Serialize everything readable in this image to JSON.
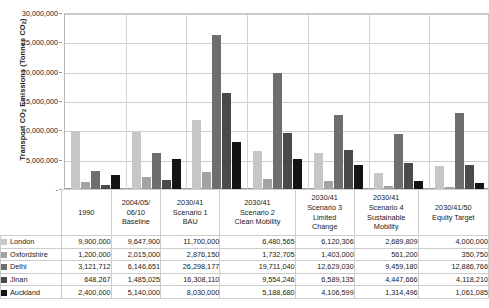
{
  "chart_data": {
    "type": "bar",
    "title": "",
    "ylabel": "Transport CO2 Emissions (Tonnes CO2)",
    "xlabel": "",
    "ylim": [
      0,
      30000000
    ],
    "ytick_values": [
      0,
      5000000,
      10000000,
      15000000,
      20000000,
      25000000,
      30000000
    ],
    "ytick_labels": [
      "-",
      "5,000,000",
      "10,000,000",
      "15,000,000",
      "20,000,000",
      "25,000,000",
      "30,000,000"
    ],
    "grid": true,
    "legend_position": "table-left",
    "categories": [
      "1990",
      "2004/05/06/10 Baseline",
      "2030/41 Scenario 1 BAU",
      "2030/41 Scenario 2 Clean Mobility",
      "2030/41 Scenario 3 Limited Change",
      "2030/41 Scenario 4 Sustainable Mobility",
      "2030/41/50 Equity Target"
    ],
    "category_lines": [
      [
        "1990"
      ],
      [
        "2004/05/",
        "06/10",
        "Baseline"
      ],
      [
        "2030/41",
        "Scenario 1",
        "BAU"
      ],
      [
        "2030/41",
        "Scenario 2",
        "Clean Mobility"
      ],
      [
        "2030/41",
        "Scenario 3",
        "Limited",
        "Change"
      ],
      [
        "2030/41",
        "Scenario 4",
        "Sustainable",
        "Mobility"
      ],
      [
        "2030/41/50",
        "Equity Target"
      ]
    ],
    "series": [
      {
        "name": "London",
        "color": "#c6c6c6",
        "values": [
          9900000,
          9647900,
          11700000,
          6480565,
          6120306,
          2689809,
          4000000
        ],
        "labels": [
          "9,900,000",
          "9,647,900",
          "11,700,000",
          "6,480,565",
          "6,120,306",
          "2,689,809",
          "4,000,000"
        ]
      },
      {
        "name": "Oxfordshire",
        "color": "#a3a3a3",
        "values": [
          1200000,
          2015000,
          2876150,
          1732705,
          1403000,
          561200,
          350750
        ],
        "labels": [
          "1,200,000",
          "2,015,000",
          "2,876,150",
          "1,732,705",
          "1,403,000",
          "561,200",
          "350,750"
        ]
      },
      {
        "name": "Delhi",
        "color": "#6e6e6e",
        "values": [
          3121712,
          6146651,
          26298177,
          19711040,
          12629030,
          9459180,
          12886766
        ],
        "labels": [
          "3,121,712",
          "6,146,651",
          "26,298,177",
          "19,711,040",
          "12,629,030",
          "9,459,180",
          "12,886,766"
        ]
      },
      {
        "name": "Jinan",
        "color": "#4a4a4a",
        "values": [
          648267,
          1485025,
          16308110,
          9554246,
          6589135,
          4447666,
          4118210
        ],
        "labels": [
          "648,267",
          "1,485,025",
          "16,308,110",
          "9,554,246",
          "6,589,135",
          "4,447,666",
          "4,118,210"
        ]
      },
      {
        "name": "Auckland",
        "color": "#141414",
        "values": [
          2400000,
          5140000,
          8030000,
          5188680,
          4106599,
          1314496,
          1061085
        ],
        "labels": [
          "2,400,000",
          "5,140,000",
          "8,030,000",
          "5,188,680",
          "4,106,599",
          "1,314,496",
          "1,061,085"
        ]
      }
    ]
  }
}
